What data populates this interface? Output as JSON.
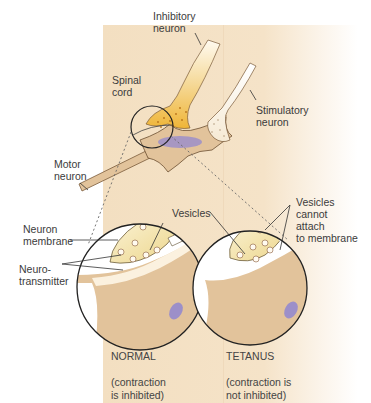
{
  "diagram": {
    "title": "",
    "labels": {
      "inhibitory_neuron": "Inhibitory\nneuron",
      "spinal_cord": "Spinal\ncord",
      "stimulatory_neuron": "Stimulatory\nneuron",
      "motor_neuron": "Motor\nneuron",
      "vesicles_normal": "Vesicles",
      "neuron_membrane": "Neuron\nmembrane",
      "neurotransmitter": "Neuro-\ntransmitter",
      "vesicles_tetanus": "Vesicles\ncannot\nattach\nto membrane"
    },
    "panels": [
      {
        "id": "normal",
        "title": "NORMAL",
        "caption": "(contraction\nis inhibited)"
      },
      {
        "id": "tetanus",
        "title": "TETANUS",
        "caption": "(contraction is\nnot inhibited)"
      }
    ],
    "colors": {
      "background": "#f3dfc1",
      "inhibitory_neuron": "#f0b93a",
      "motor_neuron": "#e2c39b",
      "stimulatory_neuron": "#f7ecd7",
      "purple_nucleus": "#9c8fc9",
      "outline": "#222222"
    }
  }
}
